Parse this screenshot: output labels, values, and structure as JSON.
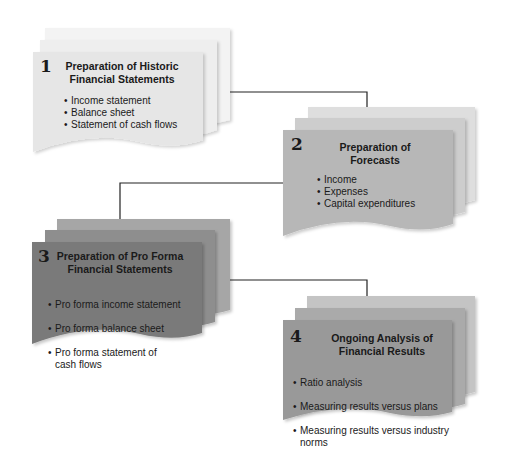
{
  "diagram": {
    "type": "process-flow",
    "steps": [
      {
        "number": "1",
        "title": "Preparation of Historic\nFinancial Statements",
        "items": [
          "Income statement",
          "Balance sheet",
          "Statement of cash flows"
        ],
        "colors": {
          "front": "#e6e6e6",
          "middle": "#eeeeee",
          "back": "#f3f3f3"
        }
      },
      {
        "number": "2",
        "title": "Preparation of\nForecasts",
        "items": [
          "Income",
          "Expenses",
          "Capital expenditures"
        ],
        "colors": {
          "front": "#b7b7b7",
          "middle": "#cdcdcd",
          "back": "#dedede"
        }
      },
      {
        "number": "3",
        "title": "Preparation of Pro Forma\nFinancial Statements",
        "items": [
          "Pro forma income statement",
          "Pro forma balance sheet",
          "Pro forma statement of\ncash flows"
        ],
        "colors": {
          "front": "#7a7a7a",
          "middle": "#8e8e8e",
          "back": "#a6a6a6"
        }
      },
      {
        "number": "4",
        "title": "Ongoing Analysis of\nFinancial Results",
        "items": [
          "Ratio analysis",
          "Measuring results versus plans",
          "Measuring results versus industry\nnorms"
        ],
        "colors": {
          "front": "#999999",
          "middle": "#aaaaaa",
          "back": "#c4c4c4"
        }
      }
    ],
    "connectors": [
      {
        "from": "1",
        "to": "2"
      },
      {
        "from": "2",
        "to": "3"
      },
      {
        "from": "3",
        "to": "4"
      }
    ],
    "line_color": "#222222"
  }
}
